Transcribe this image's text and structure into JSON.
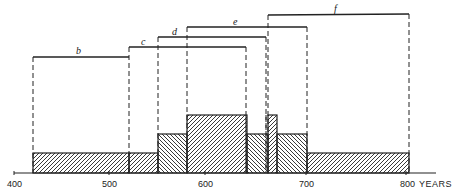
{
  "diagram": {
    "type": "overlapping-periods-histogram",
    "axis": {
      "unit_label": "YEARS",
      "ticks": [
        {
          "label": "400",
          "value": 400
        },
        {
          "label": "500",
          "value": 500
        },
        {
          "label": "600",
          "value": 600
        },
        {
          "label": "700",
          "value": 700
        },
        {
          "label": "800",
          "value": 800
        }
      ],
      "range": [
        400,
        830
      ]
    },
    "periods": [
      {
        "label": "b",
        "start": 420,
        "end": 520
      },
      {
        "label": "c",
        "start": 520,
        "end": 640
      },
      {
        "label": "d",
        "start": 550,
        "end": 660
      },
      {
        "label": "e",
        "start": 580,
        "end": 700
      },
      {
        "label": "f",
        "start": 660,
        "end": 800
      }
    ],
    "histogram_segments": [
      {
        "start": 420,
        "end": 520,
        "count": 1,
        "hatch": "right"
      },
      {
        "start": 520,
        "end": 550,
        "count": 1,
        "hatch": "right"
      },
      {
        "start": 550,
        "end": 580,
        "count": 2,
        "hatch": "left"
      },
      {
        "start": 580,
        "end": 640,
        "count": 3,
        "hatch": "right"
      },
      {
        "start": 640,
        "end": 660,
        "count": 2,
        "hatch": "left"
      },
      {
        "start": 660,
        "end": 668,
        "count": 3,
        "hatch": "right"
      },
      {
        "start": 668,
        "end": 700,
        "count": 2,
        "hatch": "left"
      },
      {
        "start": 700,
        "end": 800,
        "count": 1,
        "hatch": "right"
      }
    ],
    "colors": {
      "ink": "#222222",
      "background": "#ffffff"
    }
  }
}
